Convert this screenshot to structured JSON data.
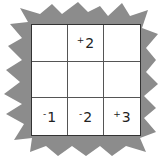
{
  "puzzle": {
    "rows": 3,
    "cols": 3,
    "cells": [
      {
        "row": 0,
        "col": 0,
        "sign": "",
        "value": ""
      },
      {
        "row": 0,
        "col": 1,
        "sign": "+",
        "value": "2"
      },
      {
        "row": 0,
        "col": 2,
        "sign": "",
        "value": ""
      },
      {
        "row": 1,
        "col": 0,
        "sign": "",
        "value": ""
      },
      {
        "row": 1,
        "col": 1,
        "sign": "",
        "value": ""
      },
      {
        "row": 1,
        "col": 2,
        "sign": "",
        "value": ""
      },
      {
        "row": 2,
        "col": 0,
        "sign": "-",
        "value": "1"
      },
      {
        "row": 2,
        "col": 1,
        "sign": "-",
        "value": "2"
      },
      {
        "row": 2,
        "col": 2,
        "sign": "+",
        "value": "3"
      }
    ]
  },
  "colors": {
    "burst": "#8a8a8a",
    "grid_line": "#333333",
    "cell_bg": "#ffffff"
  }
}
